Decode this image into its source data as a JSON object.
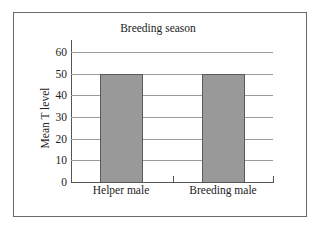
{
  "chart_data": {
    "type": "bar",
    "title": "Breeding season",
    "xlabel": "",
    "ylabel": "Mean T level",
    "categories": [
      "Helper male",
      "Breeding male"
    ],
    "values": [
      50,
      50
    ],
    "ylim": [
      0,
      60
    ],
    "yticks": [
      0,
      10,
      20,
      30,
      40,
      50,
      60
    ],
    "grid": true,
    "legend": null,
    "colors": {
      "bar_fill": "#999999",
      "bar_edge": "#5a5a5a",
      "grid": "#9a9a9a",
      "axis": "#555555"
    }
  },
  "labels": {
    "title": "Breeding season",
    "ylabel": "Mean T level",
    "yticks": [
      "0",
      "10",
      "20",
      "30",
      "40",
      "50",
      "60"
    ],
    "xticks": [
      "Helper male",
      "Breeding male"
    ]
  }
}
